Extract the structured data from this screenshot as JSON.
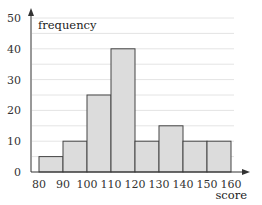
{
  "chart_data": {
    "type": "bar",
    "subtype": "histogram",
    "title": "",
    "xlabel": "score",
    "ylabel": "frequency",
    "bins": [
      [
        80,
        90
      ],
      [
        90,
        100
      ],
      [
        100,
        110
      ],
      [
        110,
        120
      ],
      [
        120,
        130
      ],
      [
        130,
        140
      ],
      [
        140,
        150
      ],
      [
        150,
        160
      ]
    ],
    "categories": [
      "80-90",
      "90-100",
      "100-110",
      "110-120",
      "120-130",
      "130-140",
      "140-150",
      "150-160"
    ],
    "values": [
      5,
      10,
      25,
      40,
      10,
      15,
      10,
      10
    ],
    "x_ticks": [
      "80",
      "90",
      "100",
      "110",
      "120",
      "130",
      "140",
      "150",
      "160"
    ],
    "y_ticks": [
      "0",
      "10",
      "20",
      "30",
      "40",
      "50"
    ],
    "xlim": [
      80,
      160
    ],
    "ylim": [
      0,
      50
    ],
    "grid": "horizontal every 5",
    "legend": "none",
    "colors": {
      "bar_fill": "#dcdcdc",
      "bar_stroke": "#444444",
      "grid": "#e4e4e4",
      "axis": "#333333"
    }
  }
}
